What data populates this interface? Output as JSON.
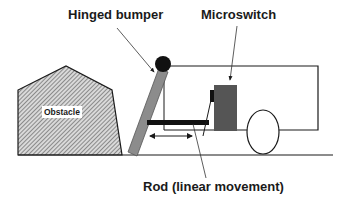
{
  "labels": {
    "hinged_bumper": "Hinged bumper",
    "microswitch": "Microswitch",
    "rod": "Rod (linear movement)",
    "obstacle": "Obstacle"
  },
  "colors": {
    "line": "#1a1a1a",
    "bumper_fill": "#8c8c8c",
    "switch_fill": "#555555",
    "obstacle_hatch": "#555555",
    "background": "#ffffff"
  }
}
